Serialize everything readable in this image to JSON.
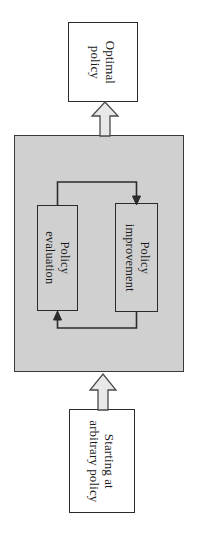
{
  "diagram": {
    "orientation": "rotated-90-clockwise",
    "colors": {
      "panel_fill": "#d0d0d0",
      "panel_border": "#3a3a3a",
      "box_fill": "#ffffff",
      "box_border": "#2b2b2b",
      "connector_stroke": "#2b2b2b",
      "block_arrow_fill": "#e8e8e8",
      "block_arrow_border": "#4a4a4a",
      "text": "#1a1a1a",
      "background": "#ffffff"
    }
  },
  "nodes": {
    "optimal_policy": {
      "label_line1": "Optimal",
      "label_line2": "policy"
    },
    "policy_evaluation": {
      "label_line1": "Policy",
      "label_line2": "evaluation"
    },
    "policy_improvement": {
      "label_line1": "Policy",
      "label_line2": "improvement"
    },
    "starting_policy": {
      "label_line1": "Starting at",
      "label_line2": "arbitrary policy"
    }
  },
  "connectors": {
    "evaluation_to_improvement": "arrow from policy evaluation to policy improvement",
    "improvement_to_evaluation": "arrow from policy improvement back to policy evaluation",
    "start_into_panel": "block arrow from starting policy into the policy iteration panel",
    "panel_to_optimal": "block arrow from the policy iteration panel to optimal policy"
  }
}
